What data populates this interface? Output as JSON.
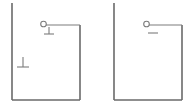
{
  "figure": {
    "title": "Two open vessel diagrams with electrode node and ground symbols",
    "background_color": "#ffffff",
    "line_color": "#7c7c7c",
    "line_color_dark": "#6a6a6a",
    "circle_fill": "#ffffff",
    "stroke_width": 1.6,
    "thin_stroke_width": 1.1,
    "canvas": {
      "width": 195,
      "height": 112
    }
  },
  "panels": [
    {
      "id": "left-panel",
      "label": "left vessel",
      "vessel": {
        "left_wall": {
          "x": 12,
          "y_top": 3,
          "y_bottom": 100
        },
        "floor": {
          "y": 100,
          "x_start": 12,
          "x_end": 80
        },
        "right_wall": {
          "x": 80,
          "y_top": 25,
          "y_bottom": 100
        }
      },
      "lid_line": {
        "y": 25,
        "x_start": 46,
        "x_end": 80
      },
      "node": {
        "cx": 43.5,
        "cy": 24,
        "r": 2.8,
        "label": "node"
      },
      "symbols": [
        {
          "name": "ground-symbol-upper",
          "glyph": "perpendicular",
          "stem_x": 49,
          "stem_y_top": 27,
          "stem_y_bottom": 34,
          "bar_y": 34,
          "bar_x_start": 44,
          "bar_x_end": 54
        },
        {
          "name": "ground-symbol-interior",
          "glyph": "perpendicular",
          "stem_x": 23,
          "stem_y_top": 57,
          "stem_y_bottom": 67,
          "bar_y": 67,
          "bar_x_start": 17,
          "bar_x_end": 29
        }
      ]
    },
    {
      "id": "right-panel",
      "label": "right vessel",
      "vessel": {
        "left_wall": {
          "x": 114,
          "y_top": 3,
          "y_bottom": 100
        },
        "floor": {
          "y": 100,
          "x_start": 114,
          "x_end": 182
        },
        "right_wall": {
          "x": 182,
          "y_top": 25,
          "y_bottom": 100
        }
      },
      "lid_line": {
        "y": 25,
        "x_start": 149,
        "x_end": 182
      },
      "node": {
        "cx": 146.5,
        "cy": 24,
        "r": 2.8,
        "label": "node"
      },
      "symbols": [
        {
          "name": "dash-mark",
          "glyph": "horizontal-dash",
          "bar_y": 33,
          "bar_x_start": 148,
          "bar_x_end": 158
        }
      ]
    }
  ]
}
